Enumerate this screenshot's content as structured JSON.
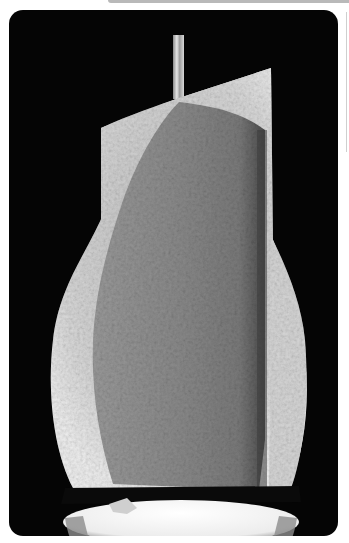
{
  "image": {
    "description": "Scanning-electron-style photograph of a sectioned bell-shaped object (cut-away crown) suspended on a thin rod above a white pedestal, on a black background",
    "frame": {
      "background": "#050505",
      "corner_radius": 14
    },
    "colors": {
      "page_background": "#ffffff",
      "surface_light": "#d9d9d9",
      "section_mid": "#8f8f8f",
      "section_dark": "#6a6a6a",
      "pedestal": "#f2f2f2",
      "rod": "#c8c8c8"
    }
  },
  "chrome": {
    "top_bar_color": "#b9b9b9",
    "side_line_color": "#cfcfcf"
  }
}
